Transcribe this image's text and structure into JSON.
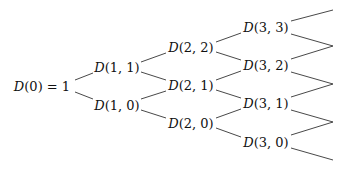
{
  "diagram": {
    "type": "binomial-tree",
    "root": {
      "label": "D(0) = 1",
      "func": "D",
      "args": "(0)",
      "suffix": " = 1"
    },
    "levels": [
      [
        {
          "id": "n11",
          "func": "D",
          "args": "(1, 1)"
        },
        {
          "id": "n10",
          "func": "D",
          "args": "(1, 0)"
        }
      ],
      [
        {
          "id": "n22",
          "func": "D",
          "args": "(2, 2)"
        },
        {
          "id": "n21",
          "func": "D",
          "args": "(2, 1)"
        },
        {
          "id": "n20",
          "func": "D",
          "args": "(2, 0)"
        }
      ],
      [
        {
          "id": "n33",
          "func": "D",
          "args": "(3, 3)"
        },
        {
          "id": "n32",
          "func": "D",
          "args": "(3, 2)"
        },
        {
          "id": "n31",
          "func": "D",
          "args": "(3, 1)"
        },
        {
          "id": "n30",
          "func": "D",
          "args": "(3, 0)"
        }
      ]
    ],
    "edge_color": "#333333",
    "text_color": "#111111"
  }
}
